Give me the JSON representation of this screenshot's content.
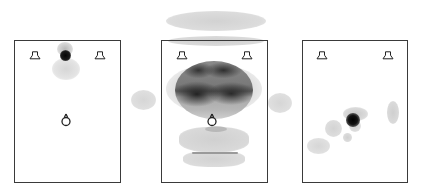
{
  "figure": {
    "colors": {
      "frame": "#3a3a3a",
      "blob_light": "#d9d9d9",
      "blob_mid": "#9a9a9a",
      "blob_dark": "#111111",
      "background": "#ffffff"
    },
    "panels": [
      {
        "id": "left",
        "label": "",
        "has_listener": true
      },
      {
        "id": "middle",
        "label": "",
        "has_listener": true
      },
      {
        "id": "right",
        "label": "",
        "has_listener": false
      }
    ],
    "icons": {
      "speaker": "loudspeaker-icon",
      "listener": "listener-head-icon"
    }
  }
}
